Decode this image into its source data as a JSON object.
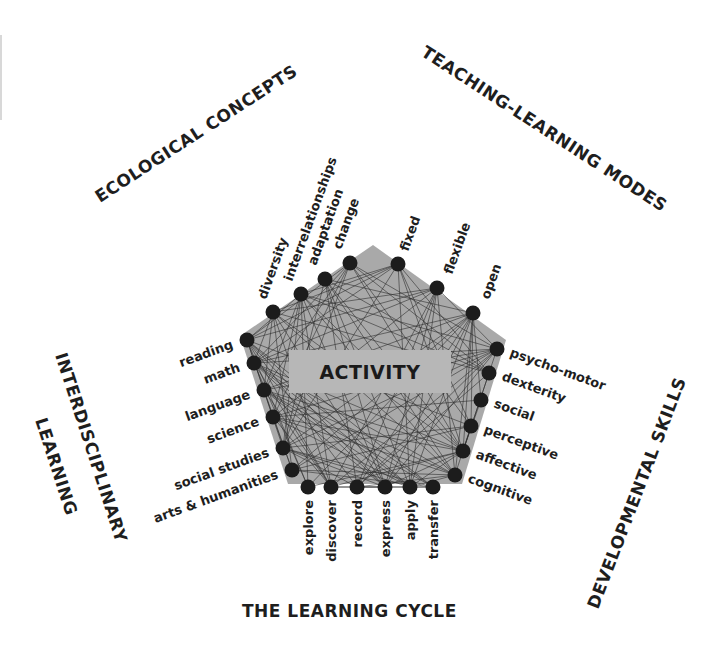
{
  "center": {
    "label": "ACTIVITY"
  },
  "colors": {
    "pentagon_fill": "#a9a9a9",
    "center_box_fill": "#b7b7b7",
    "node_fill": "#1c1c1c",
    "line_color": "#2e2e2e",
    "text_color": "#1e1e1e"
  },
  "titles": {
    "ecological": "ECOLOGICAL CONCEPTS",
    "teaching": "TEACHING-LEARNING MODES",
    "interdisciplinary_1": "INTERDISCIPLINARY",
    "interdisciplinary_2": "LEARNING",
    "developmental": "DEVELOPMENTAL SKILLS",
    "cycle": "THE LEARNING CYCLE"
  },
  "groups": {
    "ecological": {
      "title": "ECOLOGICAL CONCEPTS",
      "items": [
        "diversity",
        "interrelationships",
        "adaptation",
        "change"
      ]
    },
    "teaching": {
      "title": "TEACHING-LEARNING MODES",
      "items": [
        "fixed",
        "flexible",
        "open"
      ]
    },
    "developmental": {
      "title": "DEVELOPMENTAL SKILLS",
      "items": [
        "psycho-motor",
        "dexterity",
        "social",
        "perceptive",
        "affective",
        "cognitive"
      ]
    },
    "cycle": {
      "title": "THE LEARNING CYCLE",
      "items": [
        "explore",
        "discover",
        "record",
        "express",
        "apply",
        "transfer"
      ]
    },
    "interdisciplinary": {
      "title": "INTERDISCIPLINARY LEARNING",
      "items": [
        "reading",
        "math",
        "language",
        "science",
        "social studies",
        "arts & humanities"
      ]
    }
  },
  "nodes": [
    {
      "id": "diversity",
      "label": "diversity",
      "x": 273,
      "y": 312,
      "lx": 266,
      "ly": 300,
      "rot": -70,
      "anchor": "start"
    },
    {
      "id": "interrelationships",
      "label": "interrelationships",
      "x": 301,
      "y": 294,
      "lx": 292,
      "ly": 282,
      "rot": -70,
      "anchor": "start"
    },
    {
      "id": "adaptation",
      "label": "adaptation",
      "x": 325,
      "y": 279,
      "lx": 316,
      "ly": 266,
      "rot": -70,
      "anchor": "start"
    },
    {
      "id": "change",
      "label": "change",
      "x": 350,
      "y": 263,
      "lx": 341,
      "ly": 250,
      "rot": -70,
      "anchor": "start"
    },
    {
      "id": "fixed",
      "label": "fixed",
      "x": 398,
      "y": 264,
      "lx": 408,
      "ly": 252,
      "rot": -70,
      "anchor": "start"
    },
    {
      "id": "flexible",
      "label": "flexible",
      "x": 437,
      "y": 288,
      "lx": 452,
      "ly": 275,
      "rot": -70,
      "anchor": "start"
    },
    {
      "id": "open",
      "label": "open",
      "x": 473,
      "y": 313,
      "lx": 489,
      "ly": 300,
      "rot": -70,
      "anchor": "start"
    },
    {
      "id": "psycho-motor",
      "label": "psycho-motor",
      "x": 497,
      "y": 349,
      "lx": 509,
      "ly": 356,
      "rot": 20,
      "anchor": "start"
    },
    {
      "id": "dexterity",
      "label": "dexterity",
      "x": 489,
      "y": 373,
      "lx": 501,
      "ly": 380,
      "rot": 20,
      "anchor": "start"
    },
    {
      "id": "social",
      "label": "social",
      "x": 481,
      "y": 400,
      "lx": 493,
      "ly": 407,
      "rot": 20,
      "anchor": "start"
    },
    {
      "id": "perceptive",
      "label": "perceptive",
      "x": 471,
      "y": 426,
      "lx": 483,
      "ly": 433,
      "rot": 20,
      "anchor": "start"
    },
    {
      "id": "affective",
      "label": "affective",
      "x": 463,
      "y": 451,
      "lx": 475,
      "ly": 458,
      "rot": 20,
      "anchor": "start"
    },
    {
      "id": "cognitive",
      "label": "cognitive",
      "x": 455,
      "y": 475,
      "lx": 467,
      "ly": 482,
      "rot": 20,
      "anchor": "start"
    },
    {
      "id": "transfer",
      "label": "transfer",
      "x": 433,
      "y": 487,
      "lx": 438,
      "ly": 500,
      "rot": -90,
      "anchor": "end"
    },
    {
      "id": "apply",
      "label": "apply",
      "x": 410,
      "y": 487,
      "lx": 415,
      "ly": 500,
      "rot": -90,
      "anchor": "end"
    },
    {
      "id": "express",
      "label": "express",
      "x": 385,
      "y": 487,
      "lx": 390,
      "ly": 500,
      "rot": -90,
      "anchor": "end"
    },
    {
      "id": "record",
      "label": "record",
      "x": 357,
      "y": 487,
      "lx": 362,
      "ly": 500,
      "rot": -90,
      "anchor": "end"
    },
    {
      "id": "discover",
      "label": "discover",
      "x": 331,
      "y": 487,
      "lx": 336,
      "ly": 500,
      "rot": -90,
      "anchor": "end"
    },
    {
      "id": "explore",
      "label": "explore",
      "x": 308,
      "y": 487,
      "lx": 313,
      "ly": 500,
      "rot": -90,
      "anchor": "end"
    },
    {
      "id": "arts-humanities",
      "label": "arts & humanities",
      "x": 292,
      "y": 470,
      "lx": 279,
      "ly": 478,
      "rot": -20,
      "anchor": "end"
    },
    {
      "id": "social-studies",
      "label": "social studies",
      "x": 283,
      "y": 448,
      "lx": 270,
      "ly": 456,
      "rot": -20,
      "anchor": "end"
    },
    {
      "id": "science",
      "label": "science",
      "x": 273,
      "y": 417,
      "lx": 260,
      "ly": 425,
      "rot": -20,
      "anchor": "end"
    },
    {
      "id": "language",
      "label": "language",
      "x": 264,
      "y": 390,
      "lx": 251,
      "ly": 398,
      "rot": -20,
      "anchor": "end"
    },
    {
      "id": "math",
      "label": "math",
      "x": 254,
      "y": 363,
      "lx": 241,
      "ly": 371,
      "rot": -20,
      "anchor": "end"
    },
    {
      "id": "reading",
      "label": "reading",
      "x": 247,
      "y": 340,
      "lx": 234,
      "ly": 348,
      "rot": -20,
      "anchor": "end"
    }
  ],
  "pentagon": [
    [
      373,
      245
    ],
    [
      506,
      340
    ],
    [
      462,
      484
    ],
    [
      288,
      484
    ],
    [
      240,
      336
    ]
  ],
  "center_box": {
    "x": 289,
    "y": 350,
    "w": 162,
    "h": 43
  }
}
